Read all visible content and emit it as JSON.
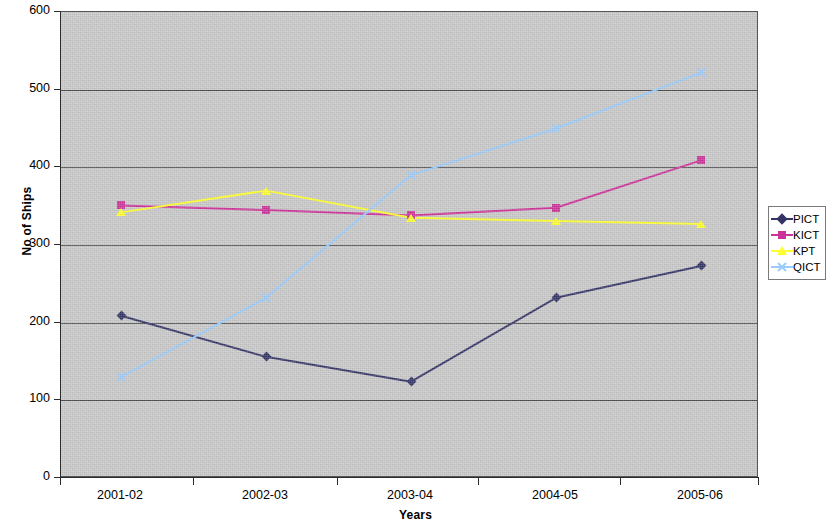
{
  "chart_data": {
    "type": "line",
    "title": "",
    "xlabel": "Years",
    "ylabel": "No of Ships",
    "categories": [
      "2001-02",
      "2002-03",
      "2003-04",
      "2004-05",
      "2005-06"
    ],
    "ylim": [
      0,
      600
    ],
    "yticks": [
      0,
      100,
      200,
      300,
      400,
      500,
      600
    ],
    "ytick_labels": [
      "0",
      "100",
      "200",
      "300",
      "400",
      "500",
      "600"
    ],
    "grid": true,
    "legend_position": "right",
    "series": [
      {
        "name": "PICT",
        "color": "#333366",
        "marker": "diamond",
        "values": [
          209,
          156,
          124,
          232,
          273
        ]
      },
      {
        "name": "KICT",
        "color": "#cc3399",
        "marker": "square",
        "values": [
          351,
          345,
          338,
          348,
          409
        ]
      },
      {
        "name": "KPT",
        "color": "#ffff33",
        "marker": "triangle",
        "values": [
          342,
          370,
          335,
          331,
          327
        ]
      },
      {
        "name": "QICT",
        "color": "#99ccff",
        "marker": "x",
        "values": [
          130,
          232,
          390,
          450,
          522
        ]
      }
    ]
  },
  "axes": {
    "y_title": "No of Ships",
    "x_title": "Years",
    "y_labels": [
      "600",
      "500",
      "400",
      "300",
      "200",
      "100",
      "0"
    ],
    "x_labels": [
      "2001-02",
      "2002-03",
      "2003-04",
      "2004-05",
      "2005-06"
    ]
  },
  "legend": {
    "entries": [
      {
        "label": "PICT"
      },
      {
        "label": "KICT"
      },
      {
        "label": "KPT"
      },
      {
        "label": "QICT"
      }
    ]
  },
  "style": {
    "plot_background": "#c9c9c9",
    "gridline_color": "#4a4a4a",
    "axis_color": "#2b2b2b",
    "page_background": "#ffffff"
  }
}
